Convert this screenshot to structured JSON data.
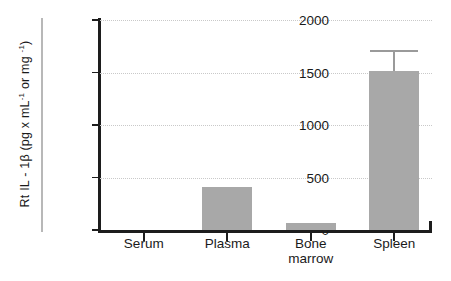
{
  "chart_data": {
    "type": "bar",
    "title": "",
    "xlabel": "",
    "ylabel": "Rt IL - 1β  (pg x mL⁻¹ or mg ⁻¹)",
    "ylabel_parts": {
      "prefix": "Rt IL - 1β  (pg x mL",
      "sup1": "-1",
      "middle": " or mg ",
      "sup2": "-1",
      "suffix": ")"
    },
    "categories": [
      "Serum",
      "Plasma",
      "Bone\nmarrow",
      "Spleen"
    ],
    "values": [
      0,
      410,
      65,
      1515
    ],
    "errors": [
      0,
      0,
      0,
      200
    ],
    "ylim": [
      0,
      2000
    ],
    "yticks": [
      0,
      500,
      1000,
      1500,
      2000
    ],
    "ytick_labels": [
      "0",
      "500",
      "1000",
      "1500",
      "2000"
    ],
    "grid": "horizontal-dotted",
    "legend": "none",
    "bar_color": "#a8a8a8",
    "axis_color": "#1d1d1d",
    "grid_color": "#c9c9c9",
    "error_color": "#9a9a9a"
  }
}
